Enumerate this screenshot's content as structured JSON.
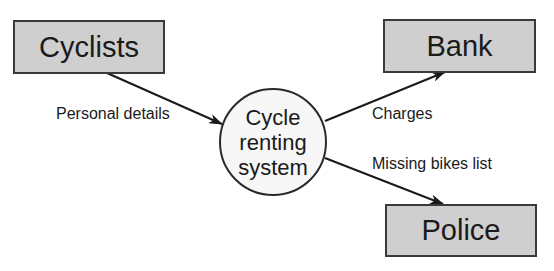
{
  "diagram": {
    "type": "data-flow-diagram",
    "entities": [
      {
        "id": "cyclists",
        "label": "Cyclists"
      },
      {
        "id": "bank",
        "label": "Bank"
      },
      {
        "id": "police",
        "label": "Police"
      }
    ],
    "process": {
      "id": "cycle-renting-system",
      "lines": [
        "Cycle",
        "renting",
        "system"
      ]
    },
    "flows": [
      {
        "from": "cyclists",
        "to": "cycle-renting-system",
        "label": "Personal details"
      },
      {
        "from": "cycle-renting-system",
        "to": "bank",
        "label": "Charges"
      },
      {
        "from": "cycle-renting-system",
        "to": "police",
        "label": "Missing bikes list"
      }
    ]
  },
  "colors": {
    "entity_fill": "#cfcfcf",
    "stroke": "#2a2a2a",
    "background": "#ffffff"
  }
}
